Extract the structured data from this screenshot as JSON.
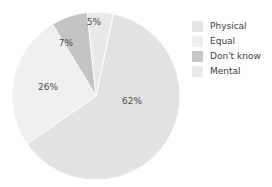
{
  "chart_data": {
    "type": "pie",
    "title": "",
    "subtitle": "",
    "xlabel": "",
    "ylabel": "",
    "legend_position": "right",
    "grid": false,
    "categories": [
      "Physical",
      "Equal",
      "Don't know",
      "Mental"
    ],
    "values": [
      62,
      26,
      7,
      5
    ],
    "value_labels": [
      "62%",
      "26%",
      "7%",
      "5%"
    ],
    "colors": [
      "#e2e2e2",
      "#f0f0f0",
      "#c4c4c4",
      "#e9e9e9"
    ],
    "slices": [
      {
        "name": "Physical",
        "value": 62,
        "label": "62%",
        "color": "#e2e2e2",
        "start_angle": 12,
        "sweep": 223.2,
        "label_x": 132,
        "label_y": 104
      },
      {
        "name": "Equal",
        "value": 26,
        "label": "26%",
        "color": "#f0f0f0",
        "start_angle": 235.2,
        "sweep": 93.6,
        "label_x": 48,
        "label_y": 90
      },
      {
        "name": "Don't know",
        "value": 7,
        "label": "7%",
        "color": "#c4c4c4",
        "start_angle": 328.8,
        "sweep": 25.2,
        "label_x": 66,
        "label_y": 46
      },
      {
        "name": "Mental",
        "value": 5,
        "label": "5%",
        "color": "#e9e9e9",
        "start_angle": 354,
        "sweep": 18,
        "label_x": 94,
        "label_y": 25
      }
    ],
    "geometry": {
      "center_x": 96,
      "center_y": 96,
      "radius": 84
    }
  },
  "legend": {
    "items": [
      {
        "label": "Physical",
        "color": "#e4e4e4"
      },
      {
        "label": "Equal",
        "color": "#efefef"
      },
      {
        "label": "Don't know",
        "color": "#c6c6c6"
      },
      {
        "label": "Mental",
        "color": "#ebebeb"
      }
    ]
  }
}
